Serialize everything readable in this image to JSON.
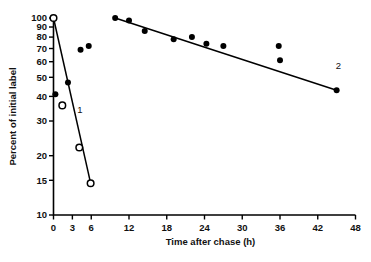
{
  "chart_data": {
    "type": "scatter",
    "title": "",
    "xlabel": "Time after chase (h)",
    "ylabel": "Percent of initial label",
    "xlim": [
      0,
      48
    ],
    "ylim": [
      10,
      100
    ],
    "yscale": "log",
    "xscale": "linear",
    "grid": false,
    "legend": "none",
    "xticks": [
      0,
      3,
      6,
      12,
      18,
      24,
      30,
      36,
      42,
      48
    ],
    "xtick_labels": [
      "0",
      "3",
      "6",
      "12",
      "18",
      "24",
      "30",
      "36",
      "42",
      "48"
    ],
    "yticks": [
      10,
      15,
      20,
      30,
      40,
      50,
      60,
      70,
      80,
      90,
      100
    ],
    "ytick_labels": [
      "10",
      "15",
      "20",
      "30",
      "40",
      "50",
      "60",
      "70",
      "80",
      "90",
      "100"
    ],
    "annotations": [
      {
        "text": "1",
        "x": 4.2,
        "y": 33.0
      },
      {
        "text": "2",
        "x": 45.3,
        "y": 55.0
      }
    ],
    "series": [
      {
        "name": "1",
        "label": "1",
        "marker": "open-circle",
        "color": "#000000",
        "points": [
          {
            "x": 0.0,
            "y": 100.0
          },
          {
            "x": 1.4,
            "y": 36.0
          },
          {
            "x": 4.1,
            "y": 22.0
          },
          {
            "x": 5.9,
            "y": 14.5
          }
        ],
        "fit_line": [
          {
            "x": 0.0,
            "y": 100.0
          },
          {
            "x": 5.9,
            "y": 14.5
          }
        ]
      },
      {
        "name": "2",
        "label": "2",
        "marker": "filled-circle",
        "color": "#000000",
        "points": [
          {
            "x": 0.3,
            "y": 41.0
          },
          {
            "x": 2.3,
            "y": 47.0
          },
          {
            "x": 4.3,
            "y": 69.0
          },
          {
            "x": 5.6,
            "y": 72.0
          },
          {
            "x": 9.8,
            "y": 100.0
          },
          {
            "x": 12.0,
            "y": 97.0
          },
          {
            "x": 14.5,
            "y": 86.0
          },
          {
            "x": 19.1,
            "y": 78.0
          },
          {
            "x": 22.0,
            "y": 80.0
          },
          {
            "x": 24.3,
            "y": 74.0
          },
          {
            "x": 27.0,
            "y": 72.0
          },
          {
            "x": 35.8,
            "y": 72.0
          },
          {
            "x": 36.0,
            "y": 61.0
          },
          {
            "x": 45.0,
            "y": 43.0
          }
        ],
        "fit_line": [
          {
            "x": 9.8,
            "y": 100.0
          },
          {
            "x": 45.0,
            "y": 43.0
          }
        ]
      }
    ]
  }
}
